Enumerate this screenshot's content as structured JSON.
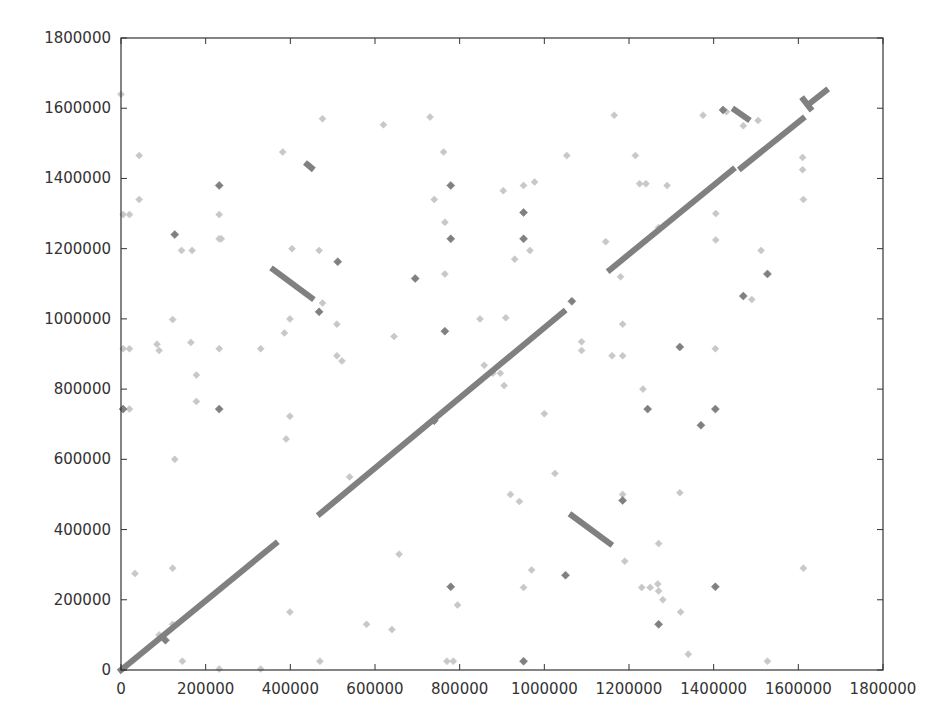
{
  "chart_data": {
    "type": "scatter",
    "title": "",
    "xlabel": "",
    "ylabel": "",
    "xlim": [
      0,
      1800000
    ],
    "ylim": [
      0,
      1800000
    ],
    "grid": false,
    "legend": null,
    "x_ticks": [
      0,
      200000,
      400000,
      600000,
      800000,
      1000000,
      1200000,
      1400000,
      1600000,
      1800000
    ],
    "y_ticks": [
      0,
      200000,
      400000,
      600000,
      800000,
      1000000,
      1200000,
      1400000,
      1600000,
      1800000
    ],
    "x_tick_labels": [
      "0",
      "200000",
      "400000",
      "600000",
      "800000",
      "1000000",
      "1200000",
      "1400000",
      "1600000",
      "1800000"
    ],
    "y_tick_labels": [
      "0",
      "200000",
      "400000",
      "600000",
      "800000",
      "1000000",
      "1200000",
      "1400000",
      "1600000",
      "1800000"
    ],
    "colors": {
      "strong": "#808080",
      "weak": "#c8c8c8",
      "axis": "#333333"
    },
    "series": [
      {
        "name": "forward-alignment-segments",
        "style": "segment",
        "color": "#808080",
        "segments": [
          [
            [
              0,
              0
            ],
            [
              365000,
              360000
            ]
          ],
          [
            [
              470000,
              445000
            ],
            [
              1045000,
              1020000
            ]
          ],
          [
            [
              1155000,
              1140000
            ],
            [
              1445000,
              1425000
            ]
          ],
          [
            [
              1465000,
              1430000
            ],
            [
              1610000,
              1570000
            ]
          ],
          [
            [
              1625000,
              1612000
            ],
            [
              1665000,
              1650000
            ]
          ]
        ]
      },
      {
        "name": "reverse-alignment-segments",
        "style": "segment",
        "color": "#808080",
        "segments": [
          [
            [
              360000,
              1140000
            ],
            [
              450000,
              1060000
            ]
          ],
          [
            [
              1065000,
              440000
            ],
            [
              1155000,
              360000
            ]
          ],
          [
            [
              1450000,
              1595000
            ],
            [
              1480000,
              1570000
            ]
          ],
          [
            [
              1612000,
              1625000
            ],
            [
              1628000,
              1600000
            ]
          ],
          [
            [
              440000,
              1440000
            ],
            [
              450000,
              1430000
            ]
          ]
        ]
      },
      {
        "name": "strong-matches",
        "style": "point",
        "color": "#808080",
        "points": [
          [
            232000,
            1380000
          ],
          [
            127000,
            1240000
          ],
          [
            232000,
            743000
          ],
          [
            5000,
            743000
          ],
          [
            512000,
            1163000
          ],
          [
            468000,
            1020000
          ],
          [
            695000,
            1115000
          ],
          [
            779000,
            1380000
          ],
          [
            779000,
            1228000
          ],
          [
            765000,
            965000
          ],
          [
            951000,
            1303000
          ],
          [
            951000,
            1228000
          ],
          [
            951000,
            25000
          ],
          [
            779000,
            237000
          ],
          [
            1050000,
            270000
          ],
          [
            1065000,
            1050000
          ],
          [
            740000,
            710000
          ],
          [
            1320000,
            920000
          ],
          [
            1244000,
            743000
          ],
          [
            1404000,
            743000
          ],
          [
            1370000,
            697000
          ],
          [
            1185000,
            483000
          ],
          [
            1270000,
            130000
          ],
          [
            1404000,
            237000
          ],
          [
            1422000,
            1595000
          ],
          [
            1470000,
            1065000
          ],
          [
            1527000,
            1128000
          ],
          [
            105000,
            85000
          ]
        ]
      },
      {
        "name": "weak-matches",
        "style": "point",
        "color": "#c8c8c8",
        "points": [
          [
            0,
            1640000
          ],
          [
            43000,
            1465000
          ],
          [
            43000,
            1340000
          ],
          [
            5000,
            1297000
          ],
          [
            20000,
            1297000
          ],
          [
            232000,
            1297000
          ],
          [
            232000,
            1228000
          ],
          [
            237000,
            1228000
          ],
          [
            143000,
            1195000
          ],
          [
            168000,
            1195000
          ],
          [
            382000,
            1475000
          ],
          [
            476000,
            1570000
          ],
          [
            620000,
            1553000
          ],
          [
            730000,
            1575000
          ],
          [
            762000,
            1475000
          ],
          [
            404000,
            1200000
          ],
          [
            468000,
            1195000
          ],
          [
            476000,
            1045000
          ],
          [
            510000,
            985000
          ],
          [
            510000,
            895000
          ],
          [
            522000,
            880000
          ],
          [
            386000,
            960000
          ],
          [
            399000,
            1000000
          ],
          [
            645000,
            950000
          ],
          [
            740000,
            1340000
          ],
          [
            765000,
            1275000
          ],
          [
            765000,
            1128000
          ],
          [
            903000,
            1365000
          ],
          [
            951000,
            1380000
          ],
          [
            977000,
            1390000
          ],
          [
            930000,
            1170000
          ],
          [
            966000,
            1195000
          ],
          [
            5000,
            915000
          ],
          [
            20000,
            915000
          ],
          [
            85000,
            928000
          ],
          [
            90000,
            910000
          ],
          [
            122000,
            998000
          ],
          [
            165000,
            933000
          ],
          [
            232000,
            915000
          ],
          [
            330000,
            915000
          ],
          [
            178000,
            840000
          ],
          [
            178000,
            765000
          ],
          [
            399000,
            723000
          ],
          [
            390000,
            658000
          ],
          [
            127000,
            600000
          ],
          [
            5000,
            743000
          ],
          [
            20000,
            743000
          ],
          [
            33000,
            275000
          ],
          [
            122000,
            290000
          ],
          [
            399000,
            165000
          ],
          [
            122000,
            130000
          ],
          [
            145000,
            25000
          ],
          [
            232000,
            3000
          ],
          [
            330000,
            3000
          ],
          [
            90000,
            100000
          ],
          [
            470000,
            25000
          ],
          [
            540000,
            550000
          ],
          [
            580000,
            130000
          ],
          [
            640000,
            115000
          ],
          [
            657000,
            330000
          ],
          [
            770000,
            25000
          ],
          [
            785000,
            25000
          ],
          [
            795000,
            185000
          ],
          [
            848000,
            1000000
          ],
          [
            858000,
            868000
          ],
          [
            878000,
            845000
          ],
          [
            896000,
            845000
          ],
          [
            905000,
            810000
          ],
          [
            909000,
            1003000
          ],
          [
            920000,
            500000
          ],
          [
            941000,
            480000
          ],
          [
            951000,
            235000
          ],
          [
            970000,
            285000
          ],
          [
            1000000,
            730000
          ],
          [
            1025000,
            560000
          ],
          [
            1053000,
            1465000
          ],
          [
            1088000,
            910000
          ],
          [
            1088000,
            935000
          ],
          [
            1145000,
            1220000
          ],
          [
            1160000,
            895000
          ],
          [
            1165000,
            1580000
          ],
          [
            1185000,
            985000
          ],
          [
            1185000,
            895000
          ],
          [
            1185000,
            500000
          ],
          [
            1180000,
            1120000
          ],
          [
            1190000,
            310000
          ],
          [
            1215000,
            1465000
          ],
          [
            1225000,
            1385000
          ],
          [
            1240000,
            1385000
          ],
          [
            1230000,
            235000
          ],
          [
            1233000,
            800000
          ],
          [
            1250000,
            235000
          ],
          [
            1268000,
            245000
          ],
          [
            1270000,
            1260000
          ],
          [
            1270000,
            360000
          ],
          [
            1270000,
            225000
          ],
          [
            1280000,
            200000
          ],
          [
            1290000,
            1380000
          ],
          [
            1320000,
            505000
          ],
          [
            1322000,
            165000
          ],
          [
            1340000,
            45000
          ],
          [
            1405000,
            1300000
          ],
          [
            1405000,
            1225000
          ],
          [
            1404000,
            915000
          ],
          [
            1430000,
            1590000
          ],
          [
            1470000,
            1550000
          ],
          [
            1490000,
            1055000
          ],
          [
            1505000,
            1565000
          ],
          [
            1512000,
            1195000
          ],
          [
            1527000,
            25000
          ],
          [
            1610000,
            1460000
          ],
          [
            1610000,
            1425000
          ],
          [
            1612000,
            1340000
          ],
          [
            1612000,
            290000
          ],
          [
            1375000,
            1580000
          ]
        ]
      }
    ]
  }
}
